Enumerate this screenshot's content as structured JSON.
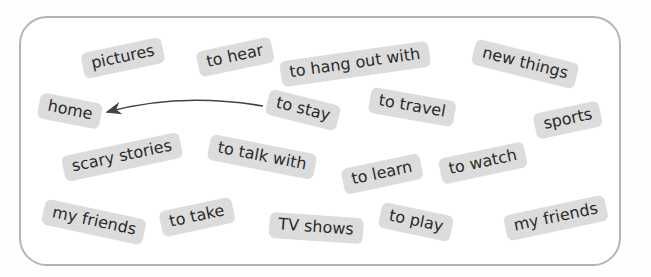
{
  "colors": {
    "tag_bg": "#dcdcdc",
    "tag_text": "#2b2b2b",
    "border": "#b4b4b4",
    "arrow": "#444444"
  },
  "tags": [
    {
      "label": "pictures",
      "x": 123,
      "y": 58,
      "rot": -12
    },
    {
      "label": "to hear",
      "x": 235,
      "y": 57,
      "rot": -12
    },
    {
      "label": "to hang out with",
      "x": 355,
      "y": 64,
      "rot": -8
    },
    {
      "label": "new things",
      "x": 525,
      "y": 64,
      "rot": 14
    },
    {
      "label": "home",
      "x": 70,
      "y": 111,
      "rot": 11
    },
    {
      "label": "to stay",
      "x": 303,
      "y": 110,
      "rot": 14
    },
    {
      "label": "to travel",
      "x": 412,
      "y": 107,
      "rot": 10
    },
    {
      "label": "sports",
      "x": 568,
      "y": 120,
      "rot": -12
    },
    {
      "label": "scary stories",
      "x": 122,
      "y": 157,
      "rot": -12
    },
    {
      "label": "to talk with",
      "x": 262,
      "y": 157,
      "rot": 11
    },
    {
      "label": "to learn",
      "x": 382,
      "y": 174,
      "rot": -12
    },
    {
      "label": "to watch",
      "x": 483,
      "y": 163,
      "rot": -12
    },
    {
      "label": "my friends",
      "x": 94,
      "y": 222,
      "rot": 12
    },
    {
      "label": "to take",
      "x": 197,
      "y": 217,
      "rot": -12
    },
    {
      "label": "TV shows",
      "x": 316,
      "y": 228,
      "rot": 4
    },
    {
      "label": "to play",
      "x": 416,
      "y": 222,
      "rot": 12
    },
    {
      "label": "my friends",
      "x": 556,
      "y": 218,
      "rot": -12
    }
  ],
  "arrow": {
    "from": "to stay",
    "to": "home"
  }
}
